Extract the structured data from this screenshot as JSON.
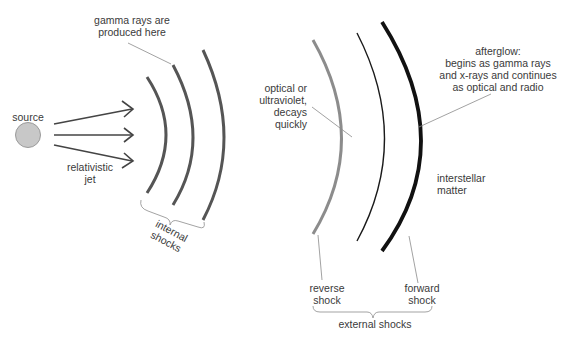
{
  "diagram": {
    "nodes": {
      "source": {
        "label": "source",
        "fill": "#c8c8c8",
        "stroke": "#9a9a9a"
      },
      "jet": {
        "label": "relativistic\njet"
      },
      "gamma": {
        "label": "gamma rays are\nproduced here"
      },
      "internal": {
        "label": "internal\nshocks"
      },
      "optical": {
        "label": "optical or\nultraviolet,\ndecays\nquickly"
      },
      "afterglow": {
        "label": "afterglow:\nbegins as gamma rays\nand x-rays and continues\nas optical and radio"
      },
      "interstellar": {
        "label": "interstellar\nmatter"
      },
      "reverse": {
        "label": "reverse\nshock"
      },
      "forward": {
        "label": "forward\nshock"
      },
      "external": {
        "label": "external shocks"
      }
    },
    "colors": {
      "internal_shock": "#555555",
      "reverse_shock": "#8c8c8c",
      "contact": "#1a1a1a",
      "forward_shock": "#111111",
      "leader": "#8a8a8a",
      "text": "#3a3a3a"
    }
  }
}
